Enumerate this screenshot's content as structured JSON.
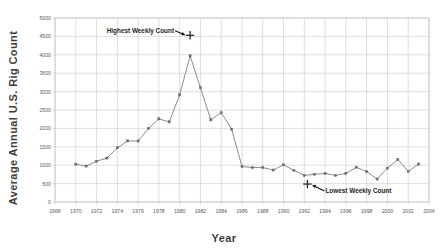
{
  "chart_data": {
    "type": "line",
    "title": "",
    "xlabel": "Year",
    "ylabel": "Average Annual  U.S.  Rig Count",
    "xlim": [
      1968,
      2004
    ],
    "ylim": [
      0,
      5000
    ],
    "xticks": [
      1968,
      1970,
      1972,
      1974,
      1976,
      1978,
      1980,
      1982,
      1984,
      1986,
      1988,
      1990,
      1992,
      1994,
      1996,
      1998,
      2000,
      2002,
      2004
    ],
    "yticks": [
      0,
      500,
      1000,
      1500,
      2000,
      2500,
      3000,
      3500,
      4000,
      4500,
      5000
    ],
    "grid": true,
    "legend": "none",
    "series": [
      {
        "name": "Average Annual U.S. Rig Count",
        "x": [
          1970,
          1971,
          1972,
          1973,
          1974,
          1975,
          1976,
          1977,
          1978,
          1979,
          1980,
          1981,
          1982,
          1983,
          1984,
          1985,
          1986,
          1987,
          1988,
          1989,
          1990,
          1991,
          1992,
          1993,
          1994,
          1995,
          1996,
          1997,
          1998,
          1999,
          2000,
          2001,
          2002,
          2003
        ],
        "values": [
          1028,
          976,
          1107,
          1194,
          1472,
          1660,
          1658,
          2001,
          2259,
          2177,
          2909,
          3970,
          3105,
          2232,
          2428,
          1980,
          964,
          936,
          936,
          869,
          1010,
          860,
          721,
          754,
          775,
          723,
          779,
          943,
          827,
          625,
          918,
          1156,
          830,
          1032
        ]
      }
    ],
    "annotations": [
      {
        "id": "highest-weekly-count",
        "label": "Highest Weekly Count",
        "marker": "plus",
        "x": 1981.0,
        "y": 4530
      },
      {
        "id": "lowest-weekly-count",
        "label": "Lowest Weekly Count",
        "marker": "plus",
        "x": 1992.3,
        "y": 488
      }
    ]
  },
  "axes": {
    "y_title": "Average Annual  U.S.  Rig Count",
    "x_title": "Year",
    "y_tick_labels": [
      "5000",
      "4500",
      "4000",
      "3500",
      "3000",
      "2500",
      "2000",
      "1500",
      "1000",
      "500",
      "0"
    ],
    "x_tick_labels": [
      "1968",
      "1970",
      "1972",
      "1974",
      "1976",
      "1978",
      "1980",
      "1982",
      "1984",
      "1986",
      "1988",
      "1990",
      "1992",
      "1994",
      "1996",
      "1998",
      "2000",
      "2002",
      "2004"
    ]
  },
  "colors": {
    "background": "#ffffff",
    "grid": "#c8c8cc",
    "series": "#6f6f72",
    "annotation": "#111111",
    "tick_text": "#5a5a5a",
    "title_text": "#3d3d3d"
  }
}
